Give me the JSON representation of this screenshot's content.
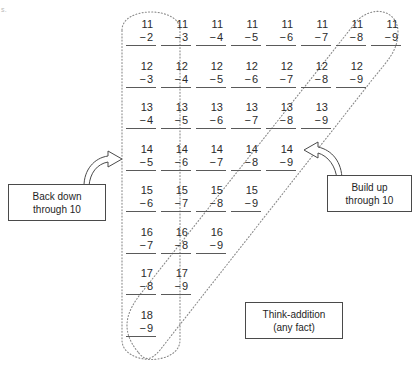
{
  "page": {
    "edge_text": "s.",
    "background_color": "#ffffff",
    "ink_color": "#2b2b2b",
    "dotted_loop_color": "#8a8a8a"
  },
  "chart_data": {
    "type": "table",
    "xlabel": "",
    "ylabel": "",
    "grid": false,
    "legend_position": "none",
    "columns": 8,
    "rows": [
      {
        "minuend": "11",
        "subtrahends": [
          "2",
          "3",
          "4",
          "5",
          "6",
          "7",
          "8",
          "9"
        ]
      },
      {
        "minuend": "12",
        "subtrahends": [
          "3",
          "4",
          "5",
          "6",
          "7",
          "8",
          "9"
        ]
      },
      {
        "minuend": "13",
        "subtrahends": [
          "4",
          "5",
          "6",
          "7",
          "8",
          "9"
        ]
      },
      {
        "minuend": "14",
        "subtrahends": [
          "5",
          "6",
          "7",
          "8",
          "9"
        ]
      },
      {
        "minuend": "15",
        "subtrahends": [
          "6",
          "7",
          "8",
          "9"
        ]
      },
      {
        "minuend": "16",
        "subtrahends": [
          "7",
          "8",
          "9"
        ]
      },
      {
        "minuend": "17",
        "subtrahends": [
          "8",
          "9"
        ]
      },
      {
        "minuend": "18",
        "subtrahends": [
          "9"
        ]
      }
    ],
    "groups": [
      {
        "name": "back-down-through-10",
        "shape": "vertical-dotted-oval",
        "label": "Back down through 10"
      },
      {
        "name": "build-up-through-10",
        "shape": "diagonal-dotted-oval",
        "label": "Build up through 10"
      },
      {
        "name": "think-addition",
        "shape": "none",
        "label": "Think-addition (any fact)"
      }
    ]
  },
  "callouts": {
    "back_down": {
      "line1": "Back down",
      "line2": "through 10"
    },
    "build_up": {
      "line1": "Build up",
      "line2": "through 10"
    },
    "think_addition": {
      "line1": "Think-addition",
      "line2": "(any fact)"
    }
  },
  "icons": {
    "arrow_left": "curved-arrow-up-right-icon",
    "arrow_right": "curved-arrow-up-left-icon"
  },
  "minus_sign": "−"
}
